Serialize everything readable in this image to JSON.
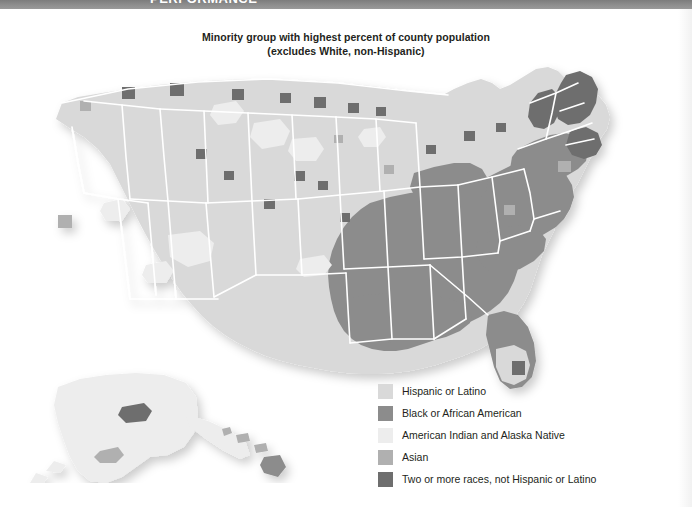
{
  "topbar": {
    "clipped_title": "PERFORMANCE",
    "color": "#8d8d8d"
  },
  "title": {
    "line1": "Minority group with highest percent of county population",
    "line2": "(excludes White, non-Hispanic)"
  },
  "legend": {
    "items": [
      {
        "label": "Hispanic or Latino",
        "color": "#d9d9d9"
      },
      {
        "label": "Black or African American",
        "color": "#8c8c8c"
      },
      {
        "label": "American Indian and Alaska Native",
        "color": "#ededed"
      },
      {
        "label": "Asian",
        "color": "#b0b0b0"
      },
      {
        "label": "Two or more races, not Hispanic or Latino",
        "color": "#6e6e6e"
      }
    ]
  },
  "map": {
    "projection": "albers-usa",
    "unit": "county",
    "insets": [
      "Alaska",
      "Hawaii"
    ],
    "state_border_color": "#ffffff",
    "background": "#ffffff",
    "palette": {
      "hispanic_or_latino": "#d9d9d9",
      "black_or_african_american": "#8c8c8c",
      "american_indian_and_alaska_native": "#ededed",
      "asian": "#b0b0b0",
      "two_or_more_races": "#6e6e6e"
    },
    "regions": [
      {
        "name": "pacific-northwest",
        "dominant": "hispanic_or_latino"
      },
      {
        "name": "california",
        "dominant": "hispanic_or_latino"
      },
      {
        "name": "great-basin",
        "dominant": "hispanic_or_latino"
      },
      {
        "name": "southwest",
        "dominant": "hispanic_or_latino"
      },
      {
        "name": "texas",
        "dominant": "hispanic_or_latino"
      },
      {
        "name": "great-plains",
        "dominant": "hispanic_or_latino"
      },
      {
        "name": "northern-plains-tribal",
        "dominant": "american_indian_and_alaska_native"
      },
      {
        "name": "upper-midwest",
        "dominant": "hispanic_or_latino"
      },
      {
        "name": "deep-south",
        "dominant": "black_or_african_american"
      },
      {
        "name": "mississippi-delta",
        "dominant": "black_or_african_american"
      },
      {
        "name": "southeast-atlantic",
        "dominant": "black_or_african_american"
      },
      {
        "name": "appalachia-ohio-valley",
        "dominant": "black_or_african_american"
      },
      {
        "name": "northeast-corridor",
        "dominant": "black_or_african_american"
      },
      {
        "name": "northern-new-england",
        "dominant": "two_or_more_races"
      },
      {
        "name": "south-florida",
        "dominant": "hispanic_or_latino"
      },
      {
        "name": "alaska",
        "dominant": "american_indian_and_alaska_native"
      },
      {
        "name": "hawaii",
        "dominant": "asian"
      }
    ]
  }
}
